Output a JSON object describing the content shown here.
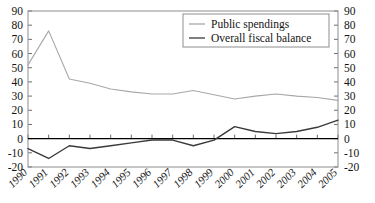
{
  "chart_data": {
    "type": "line",
    "title": "",
    "xlabel": "",
    "ylabel": "",
    "ylim": [
      -20,
      90
    ],
    "ytick_labels": [
      "90",
      "80",
      "70",
      "60",
      "50",
      "40",
      "30",
      "20",
      "10",
      "0",
      "-10",
      "-20"
    ],
    "ytick_values": [
      90,
      80,
      70,
      60,
      50,
      40,
      30,
      20,
      10,
      0,
      -10,
      -20
    ],
    "right_axis": true,
    "right_ytick_labels": [
      "90",
      "80",
      "70",
      "60",
      "50",
      "40",
      "30",
      "20",
      "10",
      "0",
      "-10",
      "-20"
    ],
    "grid": false,
    "legend_position": "upper right",
    "x": [
      "1990",
      "1991",
      "1992",
      "1993",
      "1994",
      "1995",
      "1996",
      "1997",
      "1998",
      "1999",
      "2000",
      "2001",
      "2002",
      "2003",
      "2004",
      "2005"
    ],
    "categories": [
      "1990",
      "1991",
      "1992",
      "1993",
      "1994",
      "1995",
      "1996",
      "1997",
      "1998",
      "1999",
      "2000",
      "2001",
      "2002",
      "2003",
      "2004",
      "2005"
    ],
    "series": [
      {
        "name": "Public spendings",
        "color": "#a8a8a8",
        "values": [
          52,
          76,
          42,
          39,
          35,
          33,
          31.5,
          31.5,
          34,
          31,
          28,
          30,
          31.5,
          30,
          29,
          27
        ]
      },
      {
        "name": "Overall fiscal balance",
        "color": "#3a3a3a",
        "values": [
          -7,
          -14,
          -5,
          -7,
          -5,
          -3,
          -1,
          -1,
          -5,
          -1,
          8.5,
          5,
          3.5,
          5,
          8,
          13
        ]
      }
    ]
  },
  "legend": {
    "entries": [
      {
        "label": "Public spendings"
      },
      {
        "label": "Overall fiscal balance"
      }
    ]
  },
  "axes": {
    "left_label": "",
    "right_label": ""
  }
}
